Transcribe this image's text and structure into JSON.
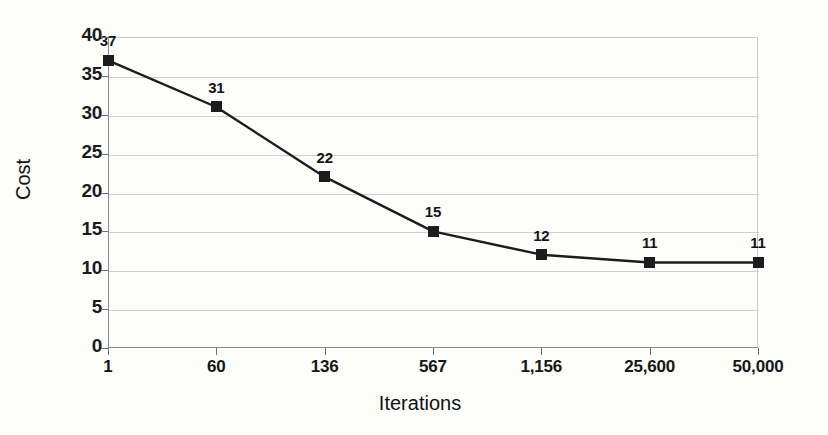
{
  "chart_data": {
    "type": "line",
    "title": "",
    "xlabel": "Iterations",
    "ylabel": "Cost",
    "categories": [
      "1",
      "60",
      "136",
      "567",
      "1,156",
      "25,600",
      "50,000"
    ],
    "values": [
      37,
      31,
      22,
      15,
      12,
      11,
      11
    ],
    "point_labels": [
      "37",
      "31",
      "22",
      "15",
      "12",
      "11",
      "11"
    ],
    "yticks": [
      "0",
      "5",
      "10",
      "15",
      "20",
      "25",
      "30",
      "35",
      "40"
    ],
    "ylim": [
      0,
      40
    ],
    "grid": true,
    "legend": "none",
    "marker": "square",
    "series_color": "#1c1c1c",
    "grid_color": "#cfcfcf",
    "background_color": "#fdfdfc"
  }
}
